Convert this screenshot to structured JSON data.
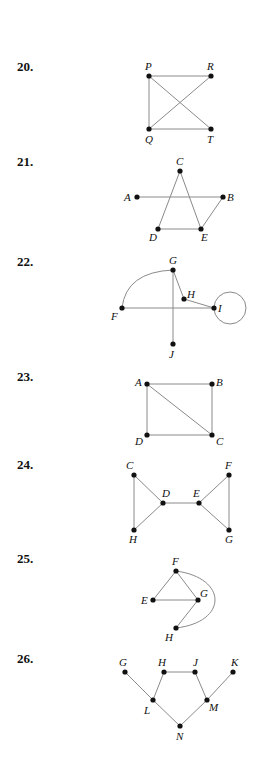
{
  "problems": [
    {
      "number": "20.",
      "top": 59
    },
    {
      "number": "21.",
      "top": 154
    },
    {
      "number": "22.",
      "top": 254
    },
    {
      "number": "23.",
      "top": 369
    },
    {
      "number": "24.",
      "top": 457
    },
    {
      "number": "25.",
      "top": 551
    },
    {
      "number": "26.",
      "top": 651
    }
  ],
  "graphs": [
    {
      "problem": "20",
      "vertices": [
        {
          "id": "P",
          "x": 149,
          "y": 76,
          "lx": 145,
          "ly": 70
        },
        {
          "id": "R",
          "x": 211,
          "y": 76,
          "lx": 207,
          "ly": 70
        },
        {
          "id": "Q",
          "x": 149,
          "y": 129,
          "lx": 145,
          "ly": 143
        },
        {
          "id": "T",
          "x": 211,
          "y": 129,
          "lx": 207,
          "ly": 143
        }
      ],
      "edges": [
        [
          "P",
          "R"
        ],
        [
          "P",
          "Q"
        ],
        [
          "P",
          "T"
        ],
        [
          "Q",
          "R"
        ],
        [
          "Q",
          "T"
        ]
      ]
    },
    {
      "problem": "21",
      "vertices": [
        {
          "id": "C",
          "x": 180,
          "y": 171,
          "lx": 176,
          "ly": 165
        },
        {
          "id": "A",
          "x": 137,
          "y": 197,
          "lx": 124,
          "ly": 201
        },
        {
          "id": "B",
          "x": 223,
          "y": 197,
          "lx": 227,
          "ly": 201
        },
        {
          "id": "D",
          "x": 158,
          "y": 229,
          "lx": 149,
          "ly": 241
        },
        {
          "id": "E",
          "x": 201,
          "y": 229,
          "lx": 201,
          "ly": 241
        }
      ],
      "edges": [
        [
          "C",
          "D"
        ],
        [
          "C",
          "E"
        ],
        [
          "A",
          "B"
        ],
        [
          "D",
          "E"
        ],
        [
          "E",
          "B"
        ]
      ]
    },
    {
      "problem": "22",
      "vertices": [
        {
          "id": "G",
          "x": 173,
          "y": 270,
          "lx": 169,
          "ly": 264
        },
        {
          "id": "H",
          "x": 184,
          "y": 299,
          "lx": 187,
          "ly": 298
        },
        {
          "id": "I",
          "x": 214,
          "y": 308,
          "lx": 218,
          "ly": 312
        },
        {
          "id": "F",
          "x": 122,
          "y": 308,
          "lx": 111,
          "ly": 320
        },
        {
          "id": "J",
          "x": 173,
          "y": 344,
          "lx": 169,
          "ly": 358
        }
      ],
      "edges": [
        [
          "G",
          "H"
        ],
        [
          "H",
          "I"
        ],
        [
          "F",
          "I"
        ],
        [
          "G",
          "J"
        ]
      ],
      "curves": [
        {
          "from": "F",
          "to": "G",
          "path": "M122,308 Q126,272 173,270"
        }
      ],
      "loops": [
        {
          "at": "I",
          "cx": 230,
          "cy": 308,
          "r": 16
        }
      ]
    },
    {
      "problem": "23",
      "vertices": [
        {
          "id": "A",
          "x": 147,
          "y": 384,
          "lx": 135,
          "ly": 386
        },
        {
          "id": "B",
          "x": 212,
          "y": 384,
          "lx": 216,
          "ly": 386
        },
        {
          "id": "D",
          "x": 147,
          "y": 435,
          "lx": 135,
          "ly": 445
        },
        {
          "id": "C",
          "x": 212,
          "y": 435,
          "lx": 216,
          "ly": 445
        }
      ],
      "edges": [
        [
          "A",
          "B"
        ],
        [
          "B",
          "C"
        ],
        [
          "C",
          "D"
        ],
        [
          "D",
          "A"
        ],
        [
          "A",
          "C"
        ]
      ]
    },
    {
      "problem": "24",
      "vertices": [
        {
          "id": "C",
          "x": 134,
          "y": 475,
          "lx": 126,
          "ly": 469
        },
        {
          "id": "D",
          "x": 163,
          "y": 503,
          "lx": 162,
          "ly": 497
        },
        {
          "id": "E",
          "x": 199,
          "y": 503,
          "lx": 193,
          "ly": 497
        },
        {
          "id": "F",
          "x": 229,
          "y": 475,
          "lx": 225,
          "ly": 469
        },
        {
          "id": "H",
          "x": 134,
          "y": 530,
          "lx": 129,
          "ly": 543
        },
        {
          "id": "G",
          "x": 229,
          "y": 530,
          "lx": 225,
          "ly": 543
        }
      ],
      "edges": [
        [
          "C",
          "H"
        ],
        [
          "C",
          "D"
        ],
        [
          "H",
          "D"
        ],
        [
          "D",
          "E"
        ],
        [
          "E",
          "F"
        ],
        [
          "E",
          "G"
        ],
        [
          "F",
          "G"
        ]
      ]
    },
    {
      "problem": "25",
      "vertices": [
        {
          "id": "F",
          "x": 176,
          "y": 571,
          "lx": 172,
          "ly": 565
        },
        {
          "id": "E",
          "x": 153,
          "y": 600,
          "lx": 141,
          "ly": 604
        },
        {
          "id": "G",
          "x": 198,
          "y": 600,
          "lx": 200,
          "ly": 597
        },
        {
          "id": "H",
          "x": 176,
          "y": 628,
          "lx": 165,
          "ly": 641
        }
      ],
      "edges": [
        [
          "F",
          "E"
        ],
        [
          "F",
          "G"
        ],
        [
          "E",
          "G"
        ],
        [
          "G",
          "H"
        ]
      ],
      "curves": [
        {
          "from": "F",
          "to": "H",
          "path": "M176,571 C228,578 228,622 176,628"
        }
      ]
    },
    {
      "problem": "26",
      "vertices": [
        {
          "id": "G",
          "x": 125,
          "y": 672,
          "lx": 119,
          "ly": 666
        },
        {
          "id": "H",
          "x": 164,
          "y": 672,
          "lx": 158,
          "ly": 666
        },
        {
          "id": "J",
          "x": 195,
          "y": 672,
          "lx": 193,
          "ly": 666
        },
        {
          "id": "K",
          "x": 233,
          "y": 672,
          "lx": 231,
          "ly": 666
        },
        {
          "id": "L",
          "x": 153,
          "y": 700,
          "lx": 144,
          "ly": 714
        },
        {
          "id": "M",
          "x": 207,
          "y": 700,
          "lx": 209,
          "ly": 711
        },
        {
          "id": "N",
          "x": 180,
          "y": 726,
          "lx": 176,
          "ly": 740
        }
      ],
      "edges": [
        [
          "G",
          "L"
        ],
        [
          "L",
          "H"
        ],
        [
          "H",
          "J"
        ],
        [
          "J",
          "M"
        ],
        [
          "M",
          "K"
        ],
        [
          "L",
          "N"
        ],
        [
          "N",
          "M"
        ]
      ]
    }
  ]
}
